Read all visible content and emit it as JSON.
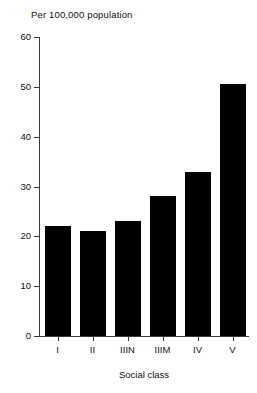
{
  "chart_data": {
    "type": "bar",
    "title": "Per 100,000 population",
    "xlabel": "Social class",
    "ylabel": "",
    "categories": [
      "I",
      "II",
      "IIIN",
      "IIIM",
      "IV",
      "V"
    ],
    "values": [
      22,
      21,
      23,
      28,
      33,
      50.5
    ],
    "ylim": [
      0,
      60
    ],
    "yticks": [
      0,
      10,
      20,
      30,
      40,
      50,
      60
    ],
    "ytick_labels": [
      "0",
      "10",
      "20",
      "30",
      "40",
      "50",
      "60"
    ],
    "grid": false,
    "legend": null,
    "bar_color": "#000000",
    "axis_color": "#3a3a3a",
    "background": "#ffffff"
  }
}
